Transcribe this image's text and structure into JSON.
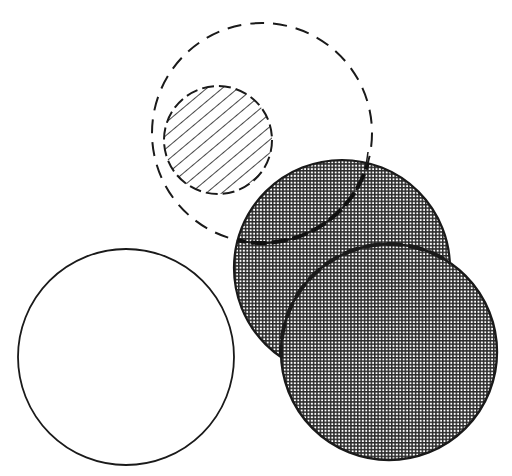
{
  "diagram": {
    "description": "Line diagram of five overlapping circles: a large dashed-outline circle containing a smaller diagonally hatched circle, two overlapping halftone-shaded circles, and a plain white outlined circle",
    "colors": {
      "background": "#ffffff",
      "stroke": "#1a1a1a",
      "halftone_dark": "#2a2a2a",
      "halftone_light": "#ffffff"
    },
    "shapes": [
      {
        "id": "dashed-circle",
        "label": "Dashed outline circle",
        "cx": 262,
        "cy": 133,
        "r": 110,
        "fill": "none",
        "stroke_style": "dashed"
      },
      {
        "id": "hatched-circle",
        "label": "Diagonally hatched circle",
        "cx": 218,
        "cy": 140,
        "r": 54,
        "fill": "diagonal-hatch",
        "stroke_style": "dashed"
      },
      {
        "id": "shaded-circle-upper",
        "label": "Upper halftone-shaded circle",
        "cx": 342,
        "cy": 268,
        "r": 108,
        "fill": "halftone",
        "stroke_style": "solid"
      },
      {
        "id": "shaded-circle-lower",
        "label": "Lower halftone-shaded circle",
        "cx": 389,
        "cy": 352,
        "r": 108,
        "fill": "halftone",
        "stroke_style": "solid-with-dashed-overlap-arc"
      },
      {
        "id": "white-circle",
        "label": "Plain white outlined circle",
        "cx": 126,
        "cy": 357,
        "r": 108,
        "fill": "white",
        "stroke_style": "solid"
      }
    ]
  }
}
